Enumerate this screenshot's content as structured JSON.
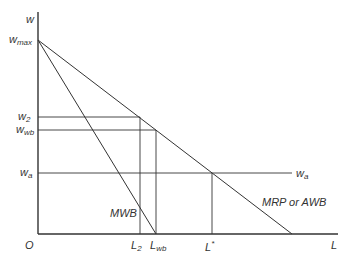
{
  "diagram": {
    "type": "economics-supply-demand",
    "axes": {
      "y_label": "w",
      "x_label": "L",
      "origin_label": "O"
    },
    "y_ticks": [
      {
        "main": "w",
        "sub": "max"
      },
      {
        "main": "w",
        "sub": "2"
      },
      {
        "main": "w",
        "sub": "wb"
      },
      {
        "main": "w",
        "sub": "a"
      }
    ],
    "x_ticks": [
      {
        "main": "L",
        "sub": "2"
      },
      {
        "main": "L",
        "sub": "wb"
      },
      {
        "main": "L",
        "sub": "*"
      }
    ],
    "curves": {
      "mwb": "MWB",
      "mrp": "MRP or AWB",
      "wa_line": {
        "main": "w",
        "sub": "a"
      }
    }
  }
}
